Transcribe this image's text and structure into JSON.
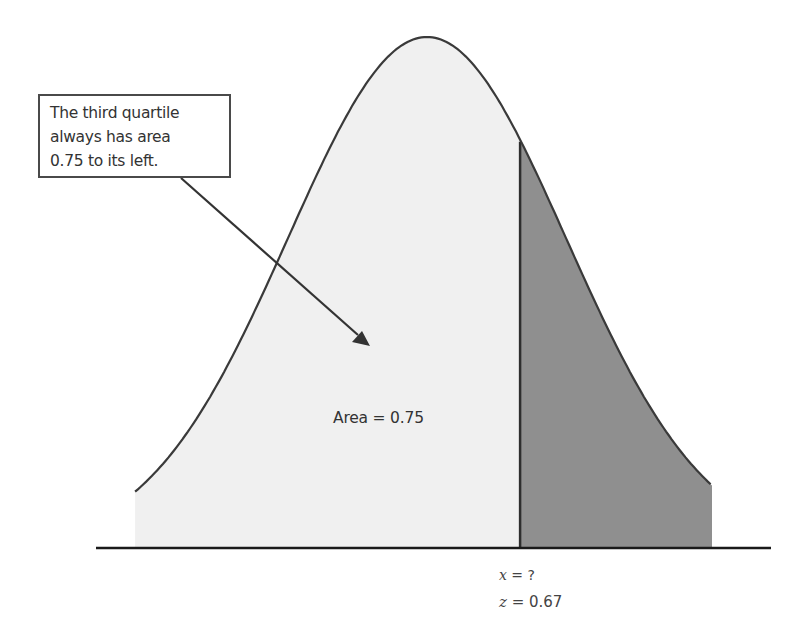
{
  "chart_data": {
    "type": "area",
    "title": "",
    "distribution": "normal",
    "xlabel": "",
    "ylabel": "",
    "grid": false,
    "legend": null,
    "mean_z": 0,
    "cutoff_z": 0.67,
    "left_area": 0.75,
    "right_area": 0.25,
    "regions": [
      {
        "name": "left",
        "from_z": "-inf",
        "to_z": 0.67,
        "area": 0.75,
        "fill": "#f0f0f0"
      },
      {
        "name": "right",
        "from_z": 0.67,
        "to_z": "inf",
        "area": 0.25,
        "fill": "#8f8f8f"
      }
    ],
    "annotations": [
      "The third quartile always has area 0.75 to its left.",
      "Area = 0.75",
      "x = ?",
      "z = 0.67"
    ]
  },
  "callout": {
    "lines": [
      "The third quartile",
      "always has area",
      "0.75 to its left."
    ]
  },
  "labels": {
    "area": "Area = 0.75",
    "x_var": "x",
    "x_eq": " = ?",
    "z_var": "z",
    "z_eq": " = 0.67"
  },
  "colors": {
    "curve": "#3a3a3a",
    "left_fill": "#f0f0f0",
    "right_fill": "#8f8f8f",
    "axis": "#1a1a1a"
  }
}
